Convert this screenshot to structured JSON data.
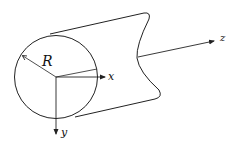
{
  "diagram": {
    "labels": {
      "radius": "R",
      "x_axis": "x",
      "y_axis": "y",
      "z_axis": "z"
    },
    "colors": {
      "stroke": "#222222",
      "background": "#ffffff"
    }
  }
}
